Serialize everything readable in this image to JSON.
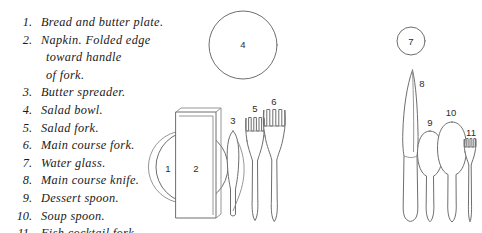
{
  "figure": {
    "background_color": "#ffffff",
    "line_color": "#6e6e6e",
    "label_color": "#2b2b2b"
  },
  "legend": {
    "items": [
      {
        "number": "1.",
        "label": "Bread and butter plate."
      },
      {
        "number": "2.",
        "label": "Napkin. Folded edge",
        "continuation": [
          "toward handle",
          "of fork."
        ]
      },
      {
        "number": "3.",
        "label": "Butter spreader."
      },
      {
        "number": "4.",
        "label": "Salad bowl."
      },
      {
        "number": "5.",
        "label": "Salad fork."
      },
      {
        "number": "6.",
        "label": "Main course fork."
      },
      {
        "number": "7.",
        "label": "Water glass."
      },
      {
        "number": "8.",
        "label": "Main course knife."
      },
      {
        "number": "9.",
        "label": "Dessert spoon."
      },
      {
        "number": "10.",
        "label": "Soup spoon."
      },
      {
        "number": "11.",
        "label": "Fish cocktail fork."
      }
    ]
  },
  "diagram": {
    "callouts": [
      {
        "id": "1",
        "text": "1",
        "x": 168,
        "y": 172,
        "item": "bread-and-butter-plate"
      },
      {
        "id": "2",
        "text": "2",
        "x": 196,
        "y": 172,
        "item": "napkin"
      },
      {
        "id": "3",
        "text": "3",
        "x": 233,
        "y": 124,
        "item": "butter-spreader"
      },
      {
        "id": "4",
        "text": "4",
        "x": 243,
        "y": 47,
        "item": "salad-bowl"
      },
      {
        "id": "5",
        "text": "5",
        "x": 255,
        "y": 112,
        "item": "salad-fork"
      },
      {
        "id": "6",
        "text": "6",
        "x": 274,
        "y": 105,
        "item": "main-course-fork"
      },
      {
        "id": "7",
        "text": "7",
        "x": 411,
        "y": 44,
        "item": "water-glass"
      },
      {
        "id": "8",
        "text": "8",
        "x": 421,
        "y": 86,
        "item": "main-course-knife"
      },
      {
        "id": "9",
        "text": "9",
        "x": 430,
        "y": 125,
        "item": "dessert-spoon"
      },
      {
        "id": "10",
        "text": "10",
        "x": 451,
        "y": 115,
        "item": "soup-spoon"
      },
      {
        "id": "11",
        "text": "11",
        "x": 470,
        "y": 135,
        "item": "fish-cocktail-fork"
      }
    ],
    "objects": [
      {
        "name": "salad-bowl",
        "shape": "circle",
        "cx": 243,
        "cy": 45,
        "r": 34
      },
      {
        "name": "water-glass",
        "shape": "circle",
        "cx": 411,
        "cy": 41,
        "r": 14
      },
      {
        "name": "bread-and-butter-plate",
        "shape": "circle",
        "cx": 186,
        "cy": 167,
        "r": 37
      },
      {
        "name": "napkin",
        "shape": "rectangle",
        "x": 176,
        "y": 112,
        "w": 40,
        "h": 106
      },
      {
        "name": "butter-spreader",
        "shape": "knife",
        "x": 233,
        "top": 130,
        "bottom": 217
      },
      {
        "name": "salad-fork",
        "shape": "fork",
        "x": 255,
        "top": 117,
        "bottom": 221,
        "tines": 4
      },
      {
        "name": "main-course-fork",
        "shape": "fork",
        "x": 275,
        "top": 110,
        "bottom": 222,
        "tines": 4
      },
      {
        "name": "main-course-knife",
        "shape": "knife",
        "x": 410,
        "top": 69,
        "bottom": 222
      },
      {
        "name": "dessert-spoon",
        "shape": "spoon",
        "x": 430,
        "top": 130,
        "bottom": 222
      },
      {
        "name": "soup-spoon",
        "shape": "spoon",
        "x": 452,
        "top": 121,
        "bottom": 222
      },
      {
        "name": "fish-cocktail-fork",
        "shape": "fork",
        "x": 470,
        "top": 138,
        "bottom": 222,
        "tines": 4
      }
    ]
  }
}
